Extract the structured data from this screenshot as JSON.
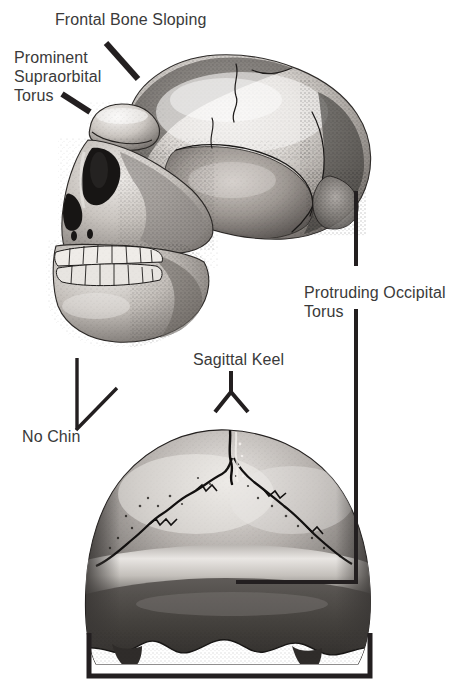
{
  "figure": {
    "kind": "anatomical-illustration",
    "background_color": "#ffffff",
    "label_color": "#3a3a3a",
    "leader_color": "#231f20",
    "views": [
      {
        "name": "lateral-skull-view",
        "description": "Left lateral view of cranium with face, teeth and mandible"
      },
      {
        "name": "posterior-skull-view",
        "description": "Posterior (rear) view of cranial vault showing lambdoid sutures and occipital torus"
      }
    ]
  },
  "labels": {
    "frontal_bone_sloping": "Frontal Bone Sloping",
    "prominent_line1": "Prominent",
    "prominent_line2": "Supraorbital",
    "prominent_line3": "Torus",
    "no_chin": "No Chin",
    "sagittal_keel": "Sagittal Keel",
    "occipital_line1": "Protruding Occipital",
    "occipital_line2": "Torus"
  },
  "annotations": {
    "frontal_bone_sloping": {
      "target": "frontal squama of lateral view",
      "leader": "diagonal-line"
    },
    "prominent_supraorbital_torus": {
      "target": "brow ridge of lateral view",
      "leader": "diagonal-line"
    },
    "no_chin": {
      "target": "mandibular symphysis of lateral view",
      "leader": "elbow-line"
    },
    "sagittal_keel": {
      "target": "midline apex of posterior view",
      "leader": "forked-line"
    },
    "protruding_occipital_torus": {
      "target": "occipital region, both views",
      "leader": "two-lines-vertical-and-elbow"
    },
    "cranial_breadth_bracket": {
      "target": "maximum cranial breadth at base of posterior view",
      "leader": "square-bracket"
    }
  }
}
